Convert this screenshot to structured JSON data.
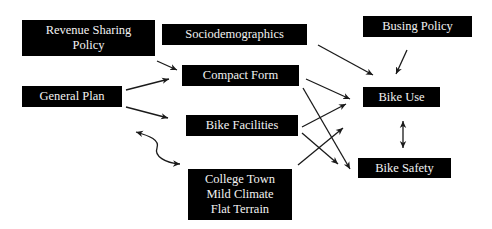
{
  "diagram": {
    "type": "causal-flow",
    "nodes": {
      "revenue_sharing": {
        "lines": [
          "Revenue Sharing",
          "Policy"
        ]
      },
      "sociodemographics": {
        "lines": [
          "Sociodemographics"
        ]
      },
      "busing_policy": {
        "lines": [
          "Busing Policy"
        ]
      },
      "compact_form": {
        "lines": [
          "Compact Form"
        ]
      },
      "general_plan": {
        "lines": [
          "General Plan"
        ]
      },
      "bike_use": {
        "lines": [
          "Bike Use"
        ]
      },
      "bike_facilities": {
        "lines": [
          "Bike Facilities"
        ]
      },
      "bike_safety": {
        "lines": [
          "Bike Safety"
        ]
      },
      "college_town": {
        "lines": [
          "College Town",
          "Mild Climate",
          "Flat Terrain"
        ]
      }
    },
    "edges": [
      {
        "from": "Revenue Sharing Policy",
        "to": "Compact Form"
      },
      {
        "from": "General Plan",
        "to": "Compact Form"
      },
      {
        "from": "General Plan",
        "to": "Bike Facilities"
      },
      {
        "from": "General Plan",
        "to": "College Town / Mild Climate / Flat Terrain",
        "bidirectional": true,
        "curved": true
      },
      {
        "from": "Sociodemographics",
        "to": "Bike Use"
      },
      {
        "from": "Busing Policy",
        "to": "Bike Use"
      },
      {
        "from": "Compact Form",
        "to": "Bike Use"
      },
      {
        "from": "Compact Form",
        "to": "Bike Safety"
      },
      {
        "from": "Bike Facilities",
        "to": "Bike Use"
      },
      {
        "from": "Bike Facilities",
        "to": "Bike Safety"
      },
      {
        "from": "College Town / Mild Climate / Flat Terrain",
        "to": "Bike Use"
      },
      {
        "from": "Bike Use",
        "to": "Bike Safety",
        "bidirectional": true
      }
    ],
    "colors": {
      "box_fill": "#000000",
      "box_text": "#f2f2f2",
      "arrow": "#1a1a1a",
      "background": "#ffffff"
    }
  }
}
